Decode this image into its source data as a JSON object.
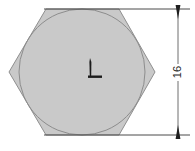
{
  "drawing": {
    "title": "Hexagon with inscribed circle and vertical dimension",
    "background_color": "#ffffff",
    "canvas": {
      "width": 195,
      "height": 151
    },
    "hexagon": {
      "name": "hexagon-outline",
      "fill_color": "#c9c9c9",
      "stroke_color": "#8f8f8f",
      "stroke_width": 1,
      "points": "46,9 119,9 155,72 119,135 46,135 9,72",
      "vertices": [
        {
          "x": 46,
          "y": 9
        },
        {
          "x": 119,
          "y": 9
        },
        {
          "x": 155,
          "y": 72
        },
        {
          "x": 119,
          "y": 135
        },
        {
          "x": 46,
          "y": 135
        },
        {
          "x": 9,
          "y": 72
        }
      ]
    },
    "inscribed_circle": {
      "name": "inscribed-circle",
      "stroke_color": "#8d8d8d",
      "fill_color": "none",
      "stroke_width": 1,
      "center_x": 82,
      "center_y": 72,
      "radius": 63
    },
    "center_mark": {
      "name": "center-mark",
      "color": "#1c1c1c",
      "x": 90,
      "y": 58,
      "vertical_length": 20,
      "horizontal_length": 14
    },
    "dimension": {
      "name": "vertical-dimension-16",
      "label": "16",
      "line_color": "#3a3a3a",
      "text_color": "#2b2b2b",
      "line_x": 178,
      "top_y": 9,
      "bottom_y": 135,
      "text_x": 178,
      "text_y": 72,
      "text_rotation": -90,
      "extension_lines": [
        {
          "name": "extension-line-top",
          "x1": 44,
          "y1": 9,
          "x2": 190,
          "y2": 9
        },
        {
          "name": "extension-line-bottom",
          "x1": 44,
          "y1": 135,
          "x2": 190,
          "y2": 135
        }
      ],
      "arrowheads": [
        {
          "name": "arrowhead-top",
          "x": 178,
          "y": 9,
          "direction": "down"
        },
        {
          "name": "arrowhead-bottom",
          "x": 178,
          "y": 135,
          "direction": "up"
        }
      ]
    }
  }
}
